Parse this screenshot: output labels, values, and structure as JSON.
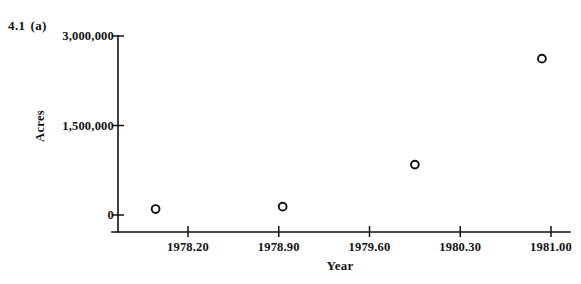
{
  "figure": {
    "number": "4.1",
    "part": "(a)"
  },
  "chart_data": {
    "type": "scatter",
    "title": "",
    "xlabel": "Year",
    "ylabel": "Acres",
    "xlim": [
      1977.85,
      1981.15
    ],
    "ylim": [
      0,
      3000000
    ],
    "grid": false,
    "legend": null,
    "marker": "open-circle",
    "x": [
      1977.95,
      1978.93,
      1979.95,
      1980.93
    ],
    "y": [
      100000,
      140000,
      845000,
      2620000
    ],
    "points": [
      {
        "x": 1977.95,
        "y": 100000
      },
      {
        "x": 1978.93,
        "y": 140000
      },
      {
        "x": 1979.95,
        "y": 845000
      },
      {
        "x": 1980.93,
        "y": 2620000
      }
    ],
    "xticks": [
      1978.2,
      1978.9,
      1979.6,
      1980.3,
      1981.0
    ],
    "xtick_labels": [
      "1978.20",
      "1978.90",
      "1979.60",
      "1980.30",
      "1981.00"
    ],
    "yticks": [
      0,
      1500000,
      3000000
    ],
    "ytick_labels": [
      "0",
      "1,500,000",
      "3,000,000"
    ],
    "axis_color": "#111111",
    "marker_color": "#111111"
  }
}
